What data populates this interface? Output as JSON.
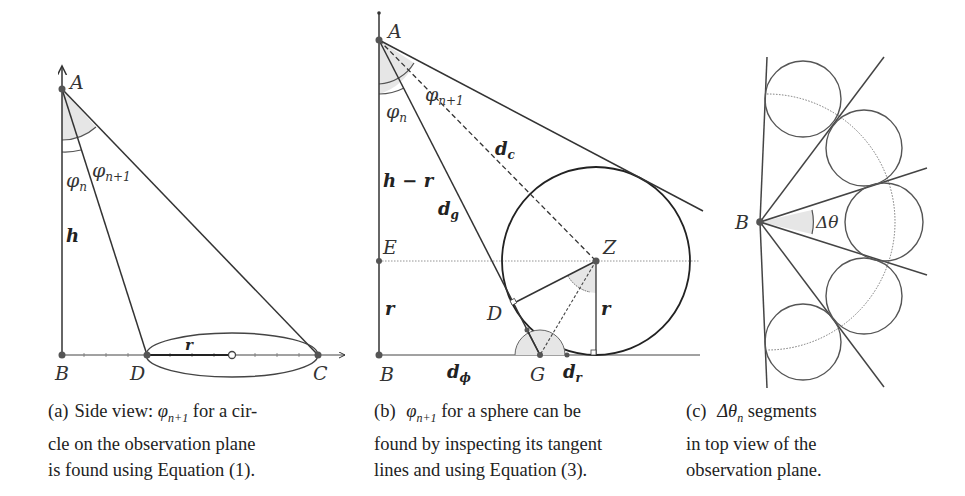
{
  "figure": {
    "panel_a": {
      "points": {
        "A": "A",
        "B": "B",
        "D": "D",
        "C": "C"
      },
      "labels": {
        "phi_n": "φ",
        "phi_n_sub": "n",
        "phi_n1": "φ",
        "phi_n1_sub": "n+1",
        "h": "h",
        "r": "r"
      },
      "caption": {
        "tag": "(a)",
        "line1": "Side view: ",
        "sym": "φ",
        "sym_sub": "n+1",
        "line1b": " for a cir-",
        "line2": "cle on the observation plane",
        "line3": "is found using Equation (1)."
      }
    },
    "panel_b": {
      "points": {
        "A": "A",
        "B": "B",
        "E": "E",
        "Z": "Z",
        "D": "D",
        "G": "G"
      },
      "labels": {
        "phi_n": "φ",
        "phi_n_sub": "n",
        "phi_n1": "φ",
        "phi_n1_sub": "n+1",
        "d_c": "d",
        "d_c_sub": "c",
        "d_g": "d",
        "d_g_sub": "g",
        "h_minus_r": "h − r",
        "r_left": "r",
        "r_right": "r",
        "d_phi": "d",
        "d_phi_sub": "ϕ",
        "d_r": "d",
        "d_r_sub": "r"
      },
      "caption": {
        "tag": "(b)",
        "sym": "φ",
        "sym_sub": "n+1",
        "line1b": " for a sphere can be",
        "line2": "found by inspecting its tangent",
        "line3": "lines and using Equation (3)."
      }
    },
    "panel_c": {
      "points": {
        "B": "B"
      },
      "labels": {
        "delta_theta": "Δθ"
      },
      "caption": {
        "tag": "(c)",
        "sym": "Δθ",
        "sym_sub": "n",
        "line1b": " segments",
        "line2": "in top view of the",
        "line3": "observation plane."
      }
    },
    "colors": {
      "line": "#333333",
      "fill_angle": "#e6e6e6",
      "thin": "#666666"
    }
  }
}
